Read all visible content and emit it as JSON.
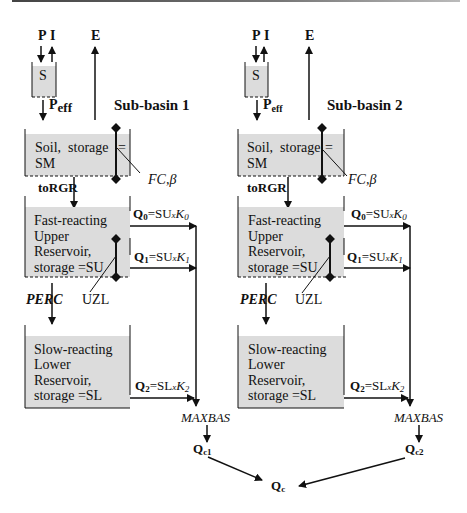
{
  "diagram": {
    "colors": {
      "box_fill": "#dcdcdc",
      "line": "#111111",
      "background": "#ffffff"
    },
    "subbasins": [
      {
        "name": "Sub-basin 1",
        "inputs": {
          "precip": "P",
          "interception": "I",
          "evap": "E"
        },
        "snow_box": "S",
        "peff": {
          "main": "P",
          "sub": "eff"
        },
        "soil_box": {
          "line1": "Soil,  storage",
          "eq": "=",
          "line2": "SM"
        },
        "soil_params": "FC,β",
        "recharge": "toRGR",
        "upper_box": {
          "lines": [
            "Fast-reacting",
            "Upper",
            "Reservoir,",
            "storage =SU"
          ]
        },
        "q0": {
          "q": "Q",
          "qsub": "0",
          "eq": "=SU",
          "x": "x",
          "k": "K",
          "ksub": "0"
        },
        "q1": {
          "q": "Q",
          "qsub": "1",
          "eq": "=SU",
          "x": "x",
          "k": "K",
          "ksub": "1"
        },
        "uzl": "UZL",
        "perc": "PERC",
        "lower_box": {
          "lines": [
            "Slow-reacting",
            "Lower",
            "Reservoir,",
            "storage =SL"
          ]
        },
        "q2": {
          "q": "Q",
          "qsub": "2",
          "eq": "=SL",
          "x": "x",
          "k": "K",
          "ksub": "2"
        },
        "routing": "MAXBAS",
        "outflow": {
          "q": "Q",
          "sub": "c1"
        }
      },
      {
        "name": "Sub-basin 2",
        "inputs": {
          "precip": "P",
          "interception": "I",
          "evap": "E"
        },
        "snow_box": "S",
        "peff": {
          "main": "P",
          "sub": "eff"
        },
        "soil_box": {
          "line1": "Soil,  storage",
          "eq": "=",
          "line2": "SM"
        },
        "soil_params": "FC,β",
        "recharge": "toRGR",
        "upper_box": {
          "lines": [
            "Fast-reacting",
            "Upper",
            "Reservoir,",
            "storage =SU"
          ]
        },
        "q0": {
          "q": "Q",
          "qsub": "0",
          "eq": "=SU",
          "x": "x",
          "k": "K",
          "ksub": "0"
        },
        "q1": {
          "q": "Q",
          "qsub": "1",
          "eq": "=SU",
          "x": "x",
          "k": "K",
          "ksub": "1"
        },
        "uzl": "UZL",
        "perc": "PERC",
        "lower_box": {
          "lines": [
            "Slow-reacting",
            "Lower",
            "Reservoir,",
            "storage =SL"
          ]
        },
        "q2": {
          "q": "Q",
          "qsub": "2",
          "eq": "=SL",
          "x": "x",
          "k": "K",
          "ksub": "2"
        },
        "routing": "MAXBAS",
        "outflow": {
          "q": "Q",
          "sub": "c2"
        }
      }
    ],
    "total_outflow": {
      "q": "Q",
      "sub": "c"
    }
  }
}
